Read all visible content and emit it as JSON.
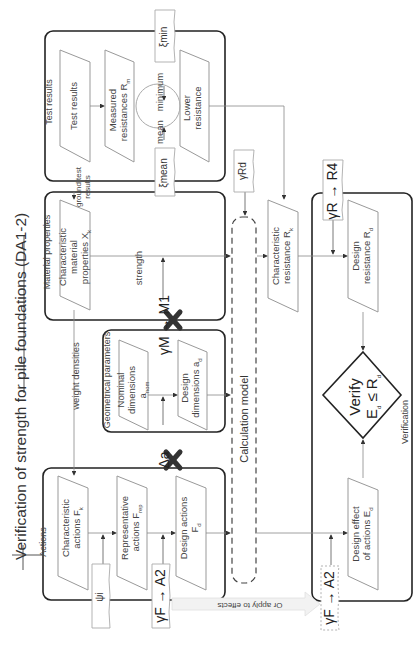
{
  "title": "Verification of strength for pile foundations (DA1-2)",
  "groups": {
    "test_results": "Test results",
    "material_properties": "Material properties",
    "geometrical_parameters": "Geometrical parameters",
    "actions": "Actions",
    "verification": "Verification"
  },
  "boxes": {
    "test_results": "Test results",
    "measured_resistances": "Measured resistances Rm",
    "lower_resistance": "Lower resistance",
    "char_material": "Characteristic material properties Xk",
    "nominal_dimensions": "Nominal dimensions anom",
    "design_dimensions": "Design dimensions ad",
    "char_actions": "Characteristic actions Fk",
    "rep_actions": "Representative actions Frep",
    "design_actions": "Design actions Fd",
    "char_resistance": "Characteristic resistance Rk",
    "design_resistance": "Design resistance Rd",
    "design_effect": "Design effect of actions Ed",
    "calculation_model": "Calculation model"
  },
  "labels": {
    "minimum": "minimum",
    "mean": "mean",
    "strength": "strength",
    "weight_densities": "weight densities",
    "ground_test_results": "ground test results",
    "or_apply_to_effects": "Or apply to effects"
  },
  "params": {
    "xi_min": "ξmin",
    "xi_mean": "ξmean",
    "gamma_rd": "γRd",
    "gamma_r_r4": "γR → R4",
    "gamma_m_m1": "γM → M1",
    "delta_a": "Δa",
    "psi_i": "ψi",
    "gamma_f_a2": "γF → A2",
    "gamma_f_a2_effects": "γF → A2"
  },
  "verify": {
    "line1": "Verify",
    "line2": "Ed ≤ Rd"
  }
}
